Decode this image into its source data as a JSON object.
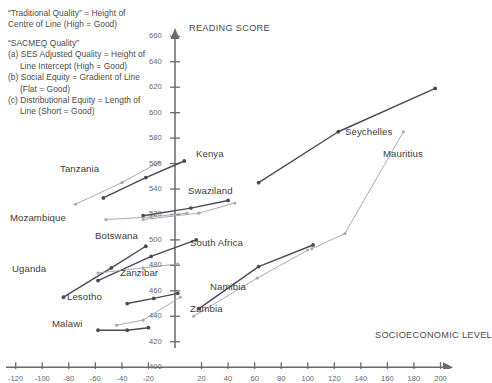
{
  "notes": {
    "traditional": "“Traditional Quality” = Height of\nCentre of Line (High = Good)",
    "sacmeq": "“SACMEQ Quality”\n(a) SES Adjusted Quality = Height of\n     Line Intercept (High = Good)\n(b) Social Equity = Gradient of Line\n     (Flat = Good)\n(c) Distributional Equity = Length of\n     Line (Short = Good)"
  },
  "chart_data": {
    "type": "line",
    "title": "",
    "xlabel": "SOCIOECONOMIC LEVEL",
    "ylabel": "READING SCORE",
    "xlim": [
      -130,
      205
    ],
    "ylim": [
      400,
      670
    ],
    "xticks": [
      -120,
      -100,
      -80,
      -60,
      -40,
      -20,
      0,
      20,
      40,
      60,
      80,
      100,
      120,
      140,
      160,
      180,
      200
    ],
    "yticks": [
      420,
      440,
      460,
      480,
      500,
      520,
      540,
      560,
      580,
      600,
      620,
      640,
      660
    ],
    "grid": false,
    "legend": "none",
    "colors": {
      "dark": "#4a4a55",
      "light": "#a9a9b2",
      "axis": "#6a6a6a",
      "text": "#3c3c3c"
    },
    "series": [
      {
        "name": "Seychelles",
        "color": "dark",
        "x": [
          63,
          123,
          196
        ],
        "values": [
          545,
          585,
          619
        ]
      },
      {
        "name": "Mauritius",
        "color": "light",
        "x": [
          103,
          128,
          172
        ],
        "values": [
          493,
          505,
          585
        ]
      },
      {
        "name": "South Africa",
        "color": "dark",
        "x": [
          18,
          63,
          104
        ],
        "values": [
          446,
          479,
          496
        ]
      },
      {
        "name": "Namibia",
        "color": "light",
        "x": [
          14,
          62,
          100
        ],
        "values": [
          440,
          470,
          492
        ]
      },
      {
        "name": "Kenya",
        "color": "dark",
        "x": [
          -54,
          -22,
          7
        ],
        "values": [
          533,
          549,
          562
        ]
      },
      {
        "name": "Tanzania",
        "color": "light",
        "x": [
          -75,
          -40,
          -12
        ],
        "values": [
          528,
          545,
          561
        ]
      },
      {
        "name": "Swaziland-dark",
        "color": "dark",
        "x": [
          -24,
          12,
          40
        ],
        "values": [
          519,
          525,
          531
        ]
      },
      {
        "name": "Swaziland-light",
        "color": "light",
        "x": [
          -24,
          18,
          45
        ],
        "values": [
          516,
          521,
          529
        ]
      },
      {
        "name": "Mozambique",
        "color": "light",
        "x": [
          -52,
          -18,
          9
        ],
        "values": [
          516,
          518,
          521
        ]
      },
      {
        "name": "Botswana",
        "color": "dark",
        "x": [
          -58,
          -18,
          16
        ],
        "values": [
          468,
          487,
          500
        ]
      },
      {
        "name": "Uganda",
        "color": "dark",
        "x": [
          -84,
          -48,
          -22
        ],
        "values": [
          455,
          478,
          495
        ]
      },
      {
        "name": "Zanzibar",
        "color": "light",
        "x": [
          -58,
          -24,
          2
        ],
        "values": [
          474,
          478,
          481
        ]
      },
      {
        "name": "Lesotho",
        "color": "dark",
        "x": [
          -36,
          -16,
          2
        ],
        "values": [
          450,
          454,
          458
        ]
      },
      {
        "name": "Malawi",
        "color": "dark",
        "x": [
          -58,
          -36,
          -20
        ],
        "values": [
          429,
          429,
          431
        ]
      },
      {
        "name": "Zambia",
        "color": "light",
        "x": [
          -44,
          -24,
          4
        ],
        "values": [
          433,
          437,
          455
        ]
      }
    ]
  },
  "labels": [
    {
      "text": "Kenya",
      "x": 196,
      "y": 148
    },
    {
      "text": "Tanzania",
      "x": 60,
      "y": 163
    },
    {
      "text": "Swaziland",
      "x": 188,
      "y": 185
    },
    {
      "text": "Mozambique",
      "x": 10,
      "y": 212
    },
    {
      "text": "Botswana",
      "x": 95,
      "y": 230
    },
    {
      "text": "South Africa",
      "x": 190,
      "y": 237
    },
    {
      "text": "Uganda",
      "x": 12,
      "y": 263
    },
    {
      "text": "Zanzibar",
      "x": 120,
      "y": 267
    },
    {
      "text": "Namibia",
      "x": 210,
      "y": 281
    },
    {
      "text": "Lesotho",
      "x": 67,
      "y": 291
    },
    {
      "text": "Zambia",
      "x": 190,
      "y": 303
    },
    {
      "text": "Malawi",
      "x": 52,
      "y": 318
    },
    {
      "text": "Seychelles",
      "x": 345,
      "y": 126
    },
    {
      "text": "Mauritius",
      "x": 383,
      "y": 148
    }
  ]
}
